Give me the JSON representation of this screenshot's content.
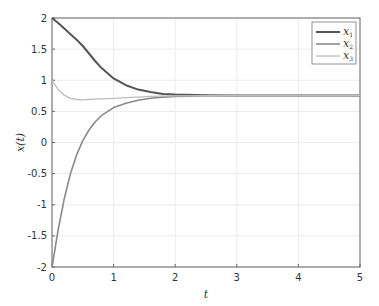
{
  "chart_data": {
    "type": "line",
    "title": "",
    "xlabel": "t",
    "ylabel": "x(t)",
    "xlim": [
      0,
      5
    ],
    "ylim": [
      -2,
      2
    ],
    "xticks": [
      "0",
      "1",
      "2",
      "3",
      "4",
      "5"
    ],
    "yticks": [
      "-2",
      "-1.5",
      "-1",
      "-0.5",
      "0",
      "0.5",
      "1",
      "1.5",
      "2"
    ],
    "grid": true,
    "legend_position": "upper right",
    "x": [
      0,
      0.1,
      0.2,
      0.3,
      0.4,
      0.5,
      0.6,
      0.7,
      0.8,
      1.0,
      1.2,
      1.4,
      1.6,
      1.8,
      2.0,
      2.5,
      3,
      4,
      5
    ],
    "series": [
      {
        "name": "x1",
        "color": "#555555",
        "values": [
          2.0,
          1.92,
          1.83,
          1.74,
          1.65,
          1.55,
          1.43,
          1.31,
          1.2,
          1.03,
          0.92,
          0.85,
          0.81,
          0.78,
          0.77,
          0.76,
          0.755,
          0.755,
          0.755
        ]
      },
      {
        "name": "x2",
        "color": "#8a8a8a",
        "values": [
          -2.0,
          -1.4,
          -0.9,
          -0.5,
          -0.2,
          0.03,
          0.2,
          0.33,
          0.43,
          0.56,
          0.63,
          0.68,
          0.71,
          0.73,
          0.74,
          0.75,
          0.755,
          0.755,
          0.755
        ]
      },
      {
        "name": "x3",
        "color": "#bdbdbd",
        "values": [
          1.0,
          0.85,
          0.76,
          0.71,
          0.69,
          0.685,
          0.69,
          0.695,
          0.7,
          0.71,
          0.72,
          0.73,
          0.74,
          0.745,
          0.75,
          0.752,
          0.755,
          0.755,
          0.755
        ]
      }
    ],
    "legend": [
      "x1",
      "x2",
      "x3"
    ]
  }
}
